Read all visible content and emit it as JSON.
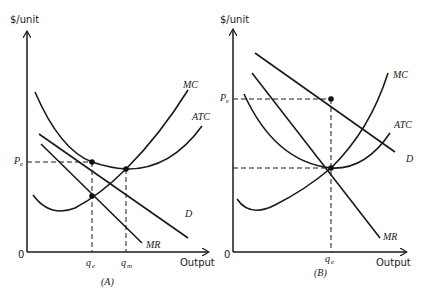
{
  "panels": [
    {
      "id": "A",
      "caption": "(A)",
      "y_axis_label": "$/unit",
      "x_axis_label": "Output",
      "origin_label": "0",
      "curves": {
        "mc": "MC",
        "atc": "ATC",
        "d": "D",
        "mr": "MR"
      },
      "price_label": {
        "base": "P",
        "sub": "e"
      },
      "quantity_labels": [
        {
          "base": "q",
          "sub": "e"
        },
        {
          "base": "q",
          "sub": "m"
        }
      ]
    },
    {
      "id": "B",
      "caption": "(B)",
      "y_axis_label": "$/unit",
      "x_axis_label": "Output",
      "origin_label": "0",
      "curves": {
        "mc": "MC",
        "atc": "ATC",
        "d": "D",
        "mr": "MR"
      },
      "price_label": {
        "base": "P",
        "sub": "e"
      },
      "quantity_labels": [
        {
          "base": "q",
          "sub": "e"
        }
      ]
    }
  ]
}
